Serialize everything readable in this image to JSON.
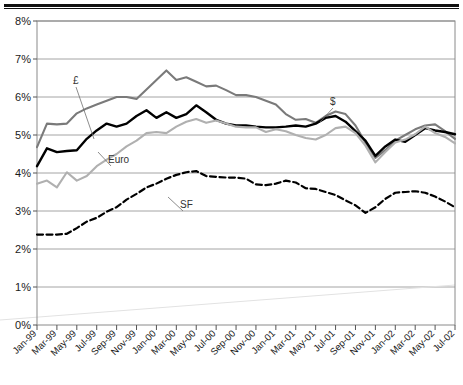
{
  "page": {
    "clipped_title_fragment": "",
    "background_color": "#ffffff"
  },
  "chart_data": {
    "type": "line",
    "title": "",
    "subtitle": "",
    "xlabel": "",
    "ylabel": "",
    "ylim": [
      0,
      8
    ],
    "ytick_values": [
      0,
      1,
      2,
      3,
      4,
      5,
      6,
      7,
      8
    ],
    "ytick_labels": [
      "0%",
      "1%",
      "2%",
      "3%",
      "4%",
      "5%",
      "6%",
      "7%",
      "8%"
    ],
    "grid": "horizontal",
    "legend_position": "inline-annotations",
    "x": [
      "Jan-99",
      "Feb-99",
      "Mar-99",
      "Apr-99",
      "May-99",
      "Jun-99",
      "Jul-99",
      "Aug-99",
      "Sep-99",
      "Oct-99",
      "Nov-99",
      "Dec-99",
      "Jan-00",
      "Feb-00",
      "Mar-00",
      "Apr-00",
      "May-00",
      "Jun-00",
      "Jul-00",
      "Aug-00",
      "Sep-00",
      "Oct-00",
      "Nov-00",
      "Dec-00",
      "Jan-01",
      "Feb-01",
      "Mar-01",
      "Apr-01",
      "May-01",
      "Jun-01",
      "Jul-01",
      "Aug-01",
      "Sep-01",
      "Oct-01",
      "Nov-01",
      "Dec-01",
      "Jan-02",
      "Feb-02",
      "Mar-02",
      "Apr-02",
      "May-02",
      "Jun-02",
      "Jul-02"
    ],
    "xtick_labels": [
      "Jan-99",
      "Mar-99",
      "May-99",
      "Jul-99",
      "Sep-99",
      "Nov-99",
      "Jan-00",
      "Mar-00",
      "May-00",
      "Jul-00",
      "Sep-00",
      "Nov-00",
      "Jan-01",
      "Mar-01",
      "May-01",
      "Jul-01",
      "Sep-01",
      "Nov-01",
      "Jan-02",
      "Mar-02",
      "May-02",
      "Jul-02"
    ],
    "xtick_step_months": 2,
    "series": [
      {
        "name": "£",
        "label": "£",
        "style": "solid",
        "color": "#7a7a7a",
        "width": 2.1,
        "values": [
          4.68,
          5.3,
          5.28,
          5.3,
          5.57,
          5.7,
          5.8,
          5.9,
          6.0,
          6.0,
          5.95,
          6.2,
          6.45,
          6.7,
          6.45,
          6.52,
          6.4,
          6.28,
          6.3,
          6.18,
          6.05,
          6.05,
          6.0,
          5.9,
          5.8,
          5.55,
          5.4,
          5.42,
          5.32,
          5.5,
          5.62,
          5.55,
          5.25,
          4.8,
          4.4,
          4.6,
          4.85,
          5.0,
          5.15,
          5.25,
          5.28,
          5.1,
          4.9
        ]
      },
      {
        "name": "$",
        "label": "$",
        "style": "solid",
        "color": "#000000",
        "width": 2.4,
        "values": [
          4.18,
          4.65,
          4.55,
          4.58,
          4.6,
          4.9,
          5.12,
          5.3,
          5.22,
          5.3,
          5.5,
          5.65,
          5.45,
          5.6,
          5.45,
          5.55,
          5.78,
          5.6,
          5.4,
          5.3,
          5.25,
          5.25,
          5.22,
          5.2,
          5.2,
          5.22,
          5.25,
          5.22,
          5.3,
          5.45,
          5.5,
          5.35,
          5.1,
          4.85,
          4.45,
          4.7,
          4.88,
          4.82,
          5.0,
          5.18,
          5.12,
          5.08,
          5.02
        ]
      },
      {
        "name": "Euro",
        "label": "Euro",
        "style": "solid",
        "color": "#b0b0b0",
        "width": 2.1,
        "values": [
          3.72,
          3.8,
          3.62,
          4.02,
          3.8,
          3.92,
          4.18,
          4.35,
          4.5,
          4.7,
          4.85,
          5.05,
          5.08,
          5.05,
          5.22,
          5.35,
          5.42,
          5.32,
          5.38,
          5.3,
          5.22,
          5.2,
          5.2,
          5.08,
          5.15,
          5.1,
          5.0,
          4.92,
          4.88,
          5.0,
          5.18,
          5.22,
          5.05,
          4.72,
          4.28,
          4.55,
          4.8,
          4.88,
          5.02,
          5.22,
          5.05,
          4.95,
          4.78
        ]
      },
      {
        "name": "SF",
        "label": "SF",
        "style": "dashed",
        "color": "#000000",
        "width": 2.2,
        "values": [
          2.38,
          2.38,
          2.38,
          2.4,
          2.55,
          2.72,
          2.82,
          2.98,
          3.1,
          3.3,
          3.45,
          3.62,
          3.72,
          3.85,
          3.95,
          4.02,
          4.05,
          3.92,
          3.9,
          3.88,
          3.88,
          3.85,
          3.7,
          3.68,
          3.72,
          3.8,
          3.75,
          3.6,
          3.58,
          3.5,
          3.42,
          3.28,
          3.15,
          2.95,
          3.1,
          3.32,
          3.48,
          3.5,
          3.52,
          3.48,
          3.38,
          3.25,
          3.1
        ]
      }
    ],
    "annotations": [
      {
        "series": "£",
        "label": "£",
        "x_px": 73,
        "y_px": 84,
        "leader_to_x_px": 94,
        "leader_to_y_px": 139
      },
      {
        "series": "Euro",
        "label": "Euro",
        "x_px": 108,
        "y_px": 163,
        "leader_to_x_px": 98,
        "leader_to_y_px": 152
      },
      {
        "series": "SF",
        "label": "SF",
        "x_px": 180,
        "y_px": 208,
        "leader_to_x_px": 168,
        "leader_to_y_px": 197
      },
      {
        "series": "$",
        "label": "$",
        "x_px": 330,
        "y_px": 105,
        "leader_to_x_px": 320,
        "leader_to_y_px": 122
      }
    ]
  }
}
